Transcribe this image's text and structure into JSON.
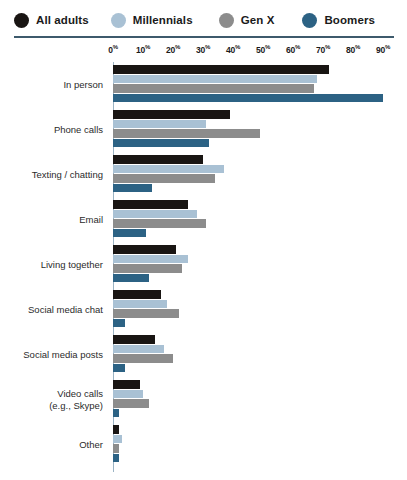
{
  "legend": {
    "items": [
      {
        "label": "All adults",
        "color": "#191513",
        "icon": "circle-swatch-icon"
      },
      {
        "label": "Millennials",
        "color": "#a9c1d4",
        "icon": "circle-swatch-icon"
      },
      {
        "label": "Gen X",
        "color": "#8c8c8c",
        "icon": "circle-swatch-icon"
      },
      {
        "label": "Boomers",
        "color": "#2c6284",
        "icon": "circle-swatch-icon"
      }
    ]
  },
  "axis": {
    "tick_labels": [
      "0",
      "10",
      "20",
      "30",
      "40",
      "50",
      "60",
      "70",
      "80",
      "90"
    ],
    "unit_suffix": "%"
  },
  "chart_data": {
    "type": "bar",
    "orientation": "horizontal",
    "title": "",
    "subtitle": "",
    "xlabel": "",
    "ylabel": "",
    "xlim": [
      0,
      95
    ],
    "grid": false,
    "legend_position": "top",
    "categories": [
      "In person",
      "Phone calls",
      "Texting / chatting",
      "Email",
      "Living together",
      "Social media chat",
      "Social media posts",
      "Video calls\n(e.g., Skype)",
      "Other"
    ],
    "tick_values": [
      0,
      10,
      20,
      30,
      40,
      50,
      60,
      70,
      80,
      90
    ],
    "tick_labels": [
      "0%",
      "10%",
      "20%",
      "30%",
      "40%",
      "50%",
      "60%",
      "70%",
      "80%",
      "90%"
    ],
    "series": [
      {
        "name": "All adults",
        "color": "#191513",
        "values": [
          72,
          39,
          30,
          25,
          21,
          16,
          14,
          9,
          2
        ]
      },
      {
        "name": "Millennials",
        "color": "#a9c1d4",
        "values": [
          68,
          31,
          37,
          28,
          25,
          18,
          17,
          10,
          3
        ]
      },
      {
        "name": "Gen X",
        "color": "#8c8c8c",
        "values": [
          67,
          49,
          34,
          31,
          23,
          22,
          20,
          12,
          2
        ]
      },
      {
        "name": "Boomers",
        "color": "#2c6284",
        "values": [
          90,
          32,
          13,
          11,
          12,
          4,
          4,
          2,
          2
        ]
      }
    ]
  }
}
